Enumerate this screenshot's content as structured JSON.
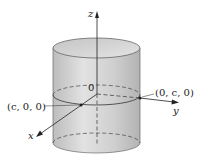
{
  "diagram": {
    "type": "3d-cylinder-with-axes",
    "axes": {
      "z_label": "z",
      "y_label": "y",
      "x_label": "x",
      "origin_label": "0"
    },
    "points": [
      {
        "label": "(c, 0, 0)",
        "description": "intersection of cylinder with x-axis"
      },
      {
        "label": "(0, c, 0)",
        "description": "intersection of cylinder with y-axis"
      }
    ],
    "colors": {
      "cylinder_fill": "#c9c9c9",
      "cylinder_top": "#d8d8d8",
      "lines": "#222222"
    }
  }
}
